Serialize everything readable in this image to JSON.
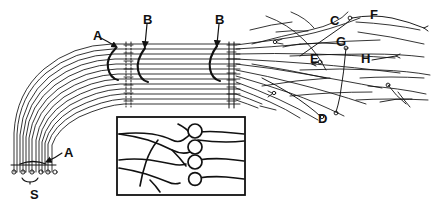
{
  "figure": {
    "kind": "line-drawing",
    "title": "",
    "background_color": "#ffffff",
    "ink_color": "#111111",
    "width": 439,
    "height": 206
  },
  "labels": [
    {
      "id": "A-top",
      "text": "A",
      "x": 93,
      "y": 29,
      "pointer": "arrow-down-right",
      "target": "proximal-node-on-bundle"
    },
    {
      "id": "B-left",
      "text": "B",
      "x": 143,
      "y": 13,
      "pointer": "arrow-down",
      "target": "node-of-ranvier-left"
    },
    {
      "id": "B-right",
      "text": "B",
      "x": 215,
      "y": 13,
      "pointer": "arrow-down",
      "target": "node-of-ranvier-right"
    },
    {
      "id": "C",
      "text": "C",
      "x": 330,
      "y": 14,
      "pointer": "none",
      "target": "fiber-ending-c"
    },
    {
      "id": "F",
      "text": "F",
      "x": 370,
      "y": 8,
      "pointer": "none",
      "target": "fiber-ending-f"
    },
    {
      "id": "G",
      "text": "G",
      "x": 336,
      "y": 35,
      "pointer": "none",
      "target": "fiber-ending-g"
    },
    {
      "id": "E",
      "text": "E",
      "x": 310,
      "y": 52,
      "pointer": "none",
      "target": "fiber-ending-e"
    },
    {
      "id": "H",
      "text": "H",
      "x": 361,
      "y": 52,
      "pointer": "none",
      "target": "fiber-ending-h"
    },
    {
      "id": "D",
      "text": "D",
      "x": 318,
      "y": 112,
      "pointer": "none",
      "target": "fiber-ending-d"
    },
    {
      "id": "A-bottom",
      "text": "A",
      "x": 64,
      "y": 146,
      "pointer": "arrow-down-left",
      "target": "distal-node-on-bundle"
    },
    {
      "id": "S",
      "text": "S",
      "x": 30,
      "y": 190,
      "pointer": "brace-above",
      "target": "sensory-endings-row"
    }
  ],
  "structures": {
    "nerve_bundle": {
      "name": "curved-nerve-fiber-bundle",
      "fiber_count": 13,
      "path": "vertical at lower-left, 90-degree bend, horizontal to the right",
      "description": "parallel axon fibers running as a tract"
    },
    "node_bands": [
      {
        "name": "node-band-1",
        "x": 126,
        "style": "dotted-vertical-pair"
      },
      {
        "name": "node-band-2",
        "x": 232,
        "style": "solid-vertical-pair"
      }
    ],
    "hook_markers": [
      {
        "name": "hook-marker-a",
        "x": 114,
        "y": 52
      },
      {
        "name": "hook-marker-b-left",
        "x": 143,
        "y": 52
      },
      {
        "name": "hook-marker-b-right",
        "x": 215,
        "y": 52
      }
    ],
    "sensory_endings": {
      "name": "sensory-ending-circles",
      "count": 6,
      "y": 172,
      "x_start": 14,
      "spacing": 9,
      "radius": 2.1
    },
    "terminal_field": {
      "name": "terminal-arborization-field",
      "description": "fibers fan out to the right into branching terminals with small ring endings",
      "ring_endings": 8
    },
    "inset": {
      "name": "inset-detail-box",
      "x": 117,
      "y": 117,
      "width": 128,
      "height": 78,
      "border_color": "#111111",
      "cell_bodies": 4,
      "description": "magnified detail: wavy fibers branching onto round cell bodies"
    }
  }
}
